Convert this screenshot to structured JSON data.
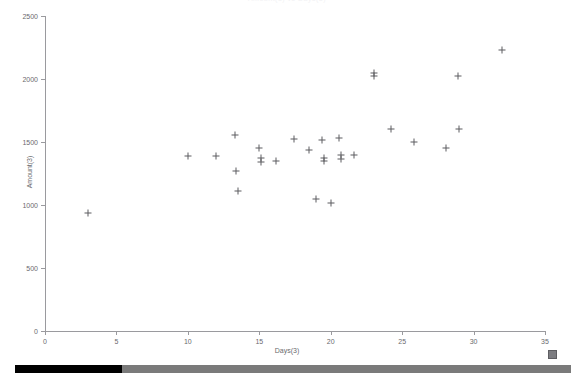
{
  "window": {
    "title_clipped": "Amount(3) vs Days(3)"
  },
  "chart_data": {
    "type": "scatter",
    "title": "Amount(3) vs Days(3)",
    "xlabel": "Days(3)",
    "ylabel": "Amount(3)",
    "xlim": [
      0,
      35
    ],
    "ylim": [
      0,
      2500
    ],
    "xticks": [
      0,
      5,
      10,
      15,
      20,
      25,
      30,
      35
    ],
    "yticks": [
      0,
      500,
      1000,
      1500,
      2000,
      2500
    ],
    "grid": false,
    "legend": null,
    "marker": "plus",
    "marker_color": "#5d5d61",
    "series": [
      {
        "name": "Amount(3)",
        "points": [
          [
            3.0,
            935
          ],
          [
            10.0,
            1390
          ],
          [
            12.0,
            1385
          ],
          [
            13.3,
            1555
          ],
          [
            13.4,
            1270
          ],
          [
            13.5,
            1110
          ],
          [
            15.0,
            1455
          ],
          [
            15.1,
            1370
          ],
          [
            15.15,
            1345
          ],
          [
            16.2,
            1350
          ],
          [
            17.4,
            1525
          ],
          [
            18.5,
            1440
          ],
          [
            19.0,
            1050
          ],
          [
            19.4,
            1515
          ],
          [
            19.5,
            1375
          ],
          [
            19.55,
            1350
          ],
          [
            20.0,
            1015
          ],
          [
            20.6,
            1530
          ],
          [
            20.7,
            1400
          ],
          [
            20.75,
            1365
          ],
          [
            21.6,
            1395
          ],
          [
            23.0,
            2050
          ],
          [
            23.05,
            2025
          ],
          [
            24.2,
            1605
          ],
          [
            25.8,
            1500
          ],
          [
            28.1,
            1455
          ],
          [
            28.9,
            2025
          ],
          [
            29.0,
            1600
          ],
          [
            32.0,
            2230
          ]
        ]
      }
    ]
  },
  "axes": {
    "x_tick_labels": [
      "0",
      "5",
      "10",
      "15",
      "20",
      "25",
      "30",
      "35"
    ],
    "y_tick_labels": [
      "0",
      "500",
      "1000",
      "1500",
      "2000",
      "2500"
    ],
    "x_title": "Days(3)",
    "y_title": "Amount(3)"
  },
  "controls": {
    "resize_handle_label": "resize-handle",
    "scrollbar_label": "horizontal-scrollbar",
    "scrollbar_thumb_label": "scrollbar-thumb"
  }
}
